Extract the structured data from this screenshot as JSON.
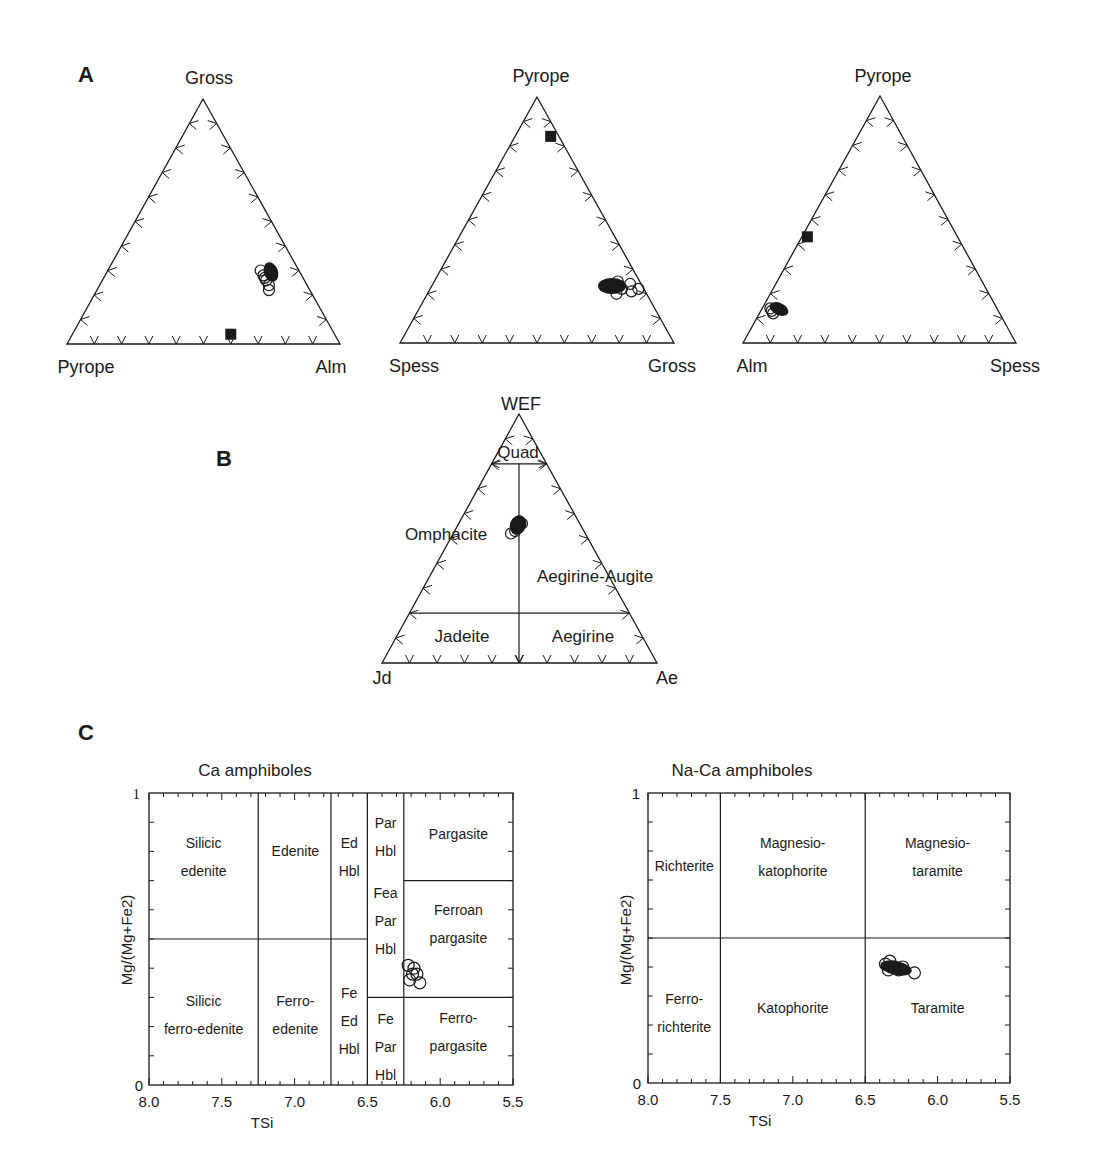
{
  "panels": {
    "A": "A",
    "B": "B",
    "C": "C"
  },
  "colors": {
    "ink": "#1a1a1a",
    "background": "#ffffff"
  },
  "chart_data": [
    {
      "type": "scatter",
      "subtype": "ternary",
      "panel": "A",
      "title": "",
      "vertices": {
        "top": "Gross",
        "left": "Pyrope",
        "right": "Alm"
      },
      "ticks_per_side": 9,
      "series": [
        {
          "name": "garnet (open circles)",
          "marker": "open-circle",
          "points": [
            {
              "top": 0.28,
              "right": 0.58
            },
            {
              "top": 0.3,
              "right": 0.56
            },
            {
              "top": 0.26,
              "right": 0.6
            },
            {
              "top": 0.24,
              "right": 0.62
            },
            {
              "top": 0.27,
              "right": 0.59
            },
            {
              "top": 0.22,
              "right": 0.63
            }
          ]
        },
        {
          "name": "filled square",
          "marker": "filled-square",
          "points": [
            {
              "top": 0.04,
              "right": 0.58
            }
          ]
        }
      ]
    },
    {
      "type": "scatter",
      "subtype": "ternary",
      "panel": "A",
      "vertices": {
        "top": "Pyrope",
        "left": "Spess",
        "right": "Gross"
      },
      "ticks_per_side": 9,
      "series": [
        {
          "name": "garnet (open circles)",
          "marker": "open-circle",
          "points": [
            {
              "top": 0.22,
              "right": 0.7
            },
            {
              "top": 0.24,
              "right": 0.72
            },
            {
              "top": 0.21,
              "right": 0.74
            },
            {
              "top": 0.25,
              "right": 0.67
            },
            {
              "top": 0.2,
              "right": 0.69
            },
            {
              "top": 0.22,
              "right": 0.76
            }
          ]
        },
        {
          "name": "filled square",
          "marker": "filled-square",
          "points": [
            {
              "top": 0.84,
              "right": 0.13
            }
          ]
        }
      ]
    },
    {
      "type": "scatter",
      "subtype": "ternary",
      "panel": "A",
      "vertices": {
        "top": "Pyrope",
        "left": "Alm",
        "right": "Spess"
      },
      "ticks_per_side": 9,
      "series": [
        {
          "name": "garnet (open circles)",
          "marker": "open-circle",
          "points": [
            {
              "top": 0.14,
              "right": 0.03
            },
            {
              "top": 0.13,
              "right": 0.04
            },
            {
              "top": 0.12,
              "right": 0.05
            }
          ]
        },
        {
          "name": "filled square",
          "marker": "filled-square",
          "points": [
            {
              "top": 0.43,
              "right": 0.02
            }
          ]
        }
      ]
    },
    {
      "type": "scatter",
      "subtype": "ternary",
      "panel": "B",
      "vertices": {
        "top": "WEF",
        "left": "Jd",
        "right": "Ae"
      },
      "fields": [
        "Quad",
        "Omphacite",
        "Aegirine-Augite",
        "Jadeite",
        "Aegirine"
      ],
      "boundaries": {
        "quad_line_WEF": 0.8,
        "lower_line_WEF": 0.2,
        "vertical_split": "Jd=Ae"
      },
      "series": [
        {
          "name": "clinopyroxene",
          "marker": "open-circle",
          "points": [
            {
              "top": 0.55,
              "right": 0.22
            },
            {
              "top": 0.56,
              "right": 0.23
            },
            {
              "top": 0.53,
              "right": 0.22
            },
            {
              "top": 0.52,
              "right": 0.21
            }
          ]
        }
      ]
    },
    {
      "type": "scatter",
      "panel": "C",
      "title": "Ca amphiboles",
      "xlabel": "TSi",
      "ylabel": "Mg/(Mg+Fe2)",
      "xlim": [
        8.0,
        5.5
      ],
      "ylim": [
        0,
        1
      ],
      "xticks": [
        "8.0",
        "7.5",
        "7.0",
        "6.5",
        "6.0",
        "5.5"
      ],
      "yticks": [
        "0",
        "1"
      ],
      "fields": [
        {
          "lines": [
            "Silicic",
            "edenite"
          ]
        },
        {
          "lines": [
            "Edenite"
          ]
        },
        {
          "lines": [
            "Ed",
            "Hbl"
          ]
        },
        {
          "lines": [
            "Par",
            "Hbl"
          ]
        },
        {
          "lines": [
            "Pargasite"
          ]
        },
        {
          "lines": [
            "Fea",
            "Par",
            "Hbl"
          ]
        },
        {
          "lines": [
            "Ferroan",
            "pargasite"
          ]
        },
        {
          "lines": [
            "Silicic",
            "ferro-edenite"
          ]
        },
        {
          "lines": [
            "Ferro-",
            "edenite"
          ]
        },
        {
          "lines": [
            "Fe",
            "Ed",
            "Hbl"
          ]
        },
        {
          "lines": [
            "Fe",
            "Par",
            "Hbl"
          ]
        },
        {
          "lines": [
            "Ferro-",
            "pargasite"
          ]
        }
      ],
      "series": [
        {
          "name": "amphibole",
          "marker": "open-circle",
          "points": [
            {
              "x": 6.22,
              "y": 0.41
            },
            {
              "x": 6.18,
              "y": 0.4
            },
            {
              "x": 6.16,
              "y": 0.38
            },
            {
              "x": 6.21,
              "y": 0.36
            },
            {
              "x": 6.14,
              "y": 0.35
            },
            {
              "x": 6.19,
              "y": 0.38
            }
          ]
        }
      ]
    },
    {
      "type": "scatter",
      "panel": "C",
      "title": "Na-Ca amphiboles",
      "xlabel": "TSi",
      "ylabel": "Mg/(Mg+Fe2)",
      "xlim": [
        8.0,
        5.5
      ],
      "ylim": [
        0,
        1
      ],
      "xticks": [
        "8.0",
        "7.5",
        "7.0",
        "6.5",
        "6.0",
        "5.5"
      ],
      "yticks": [
        "0",
        "1"
      ],
      "fields": [
        {
          "lines": [
            "Richterite"
          ]
        },
        {
          "lines": [
            "Magnesio-",
            "katophorite"
          ]
        },
        {
          "lines": [
            "Magnesio-",
            "taramite"
          ]
        },
        {
          "lines": [
            "Ferro-",
            "richterite"
          ]
        },
        {
          "lines": [
            "Katophorite"
          ]
        },
        {
          "lines": [
            "Taramite"
          ]
        }
      ],
      "series": [
        {
          "name": "amphibole",
          "marker": "open-circle",
          "points": [
            {
              "x": 6.36,
              "y": 0.41
            },
            {
              "x": 6.33,
              "y": 0.42
            },
            {
              "x": 6.3,
              "y": 0.4
            },
            {
              "x": 6.27,
              "y": 0.39
            },
            {
              "x": 6.24,
              "y": 0.4
            },
            {
              "x": 6.34,
              "y": 0.39
            },
            {
              "x": 6.16,
              "y": 0.38
            }
          ]
        }
      ]
    }
  ]
}
